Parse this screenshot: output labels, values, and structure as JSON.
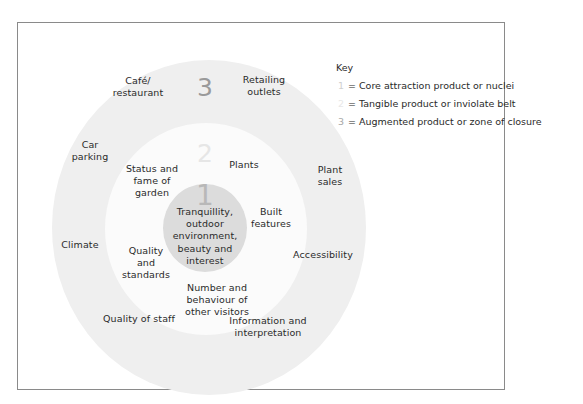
{
  "diagram": {
    "zones": [
      {
        "number": "1",
        "name": "Core attraction product or nuclei"
      },
      {
        "number": "2",
        "name": "Tangible product or inviolate belt"
      },
      {
        "number": "3",
        "name": "Augmented product or zone of closure"
      }
    ],
    "core_label": "Tranquillity,\noutdoor\nenvironment,\nbeauty and\ninterest",
    "zone2_labels": {
      "status": "Status and\nfame of\ngarden",
      "plants": "Plants",
      "built": "Built\nfeatures",
      "quality": "Quality\nand\nstandards",
      "visitors": "Number and\nbehaviour of\nother visitors"
    },
    "zone3_labels": {
      "cafe": "Café/\nrestaurant",
      "retail": "Retailing\noutlets",
      "car": "Car\nparking",
      "plant_sales": "Plant\nsales",
      "climate": "Climate",
      "access": "Accessibility",
      "staff": "Quality of staff",
      "info": "Information and\ninterpretation"
    }
  },
  "key": {
    "title": "Key",
    "items": [
      {
        "number": "1",
        "text": "= Core attraction product or nuclei"
      },
      {
        "number": "2",
        "text": "= Tangible product or inviolate belt"
      },
      {
        "number": "3",
        "text": "= Augmented product or zone of closure"
      }
    ]
  },
  "colors": {
    "zone1": "#dcdcdc",
    "zone2": "#fbfbfb",
    "zone3": "#efefef",
    "border": "#8a8a8a"
  }
}
